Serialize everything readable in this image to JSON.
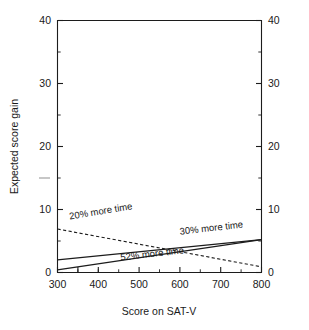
{
  "chart_data": {
    "type": "line",
    "title": "",
    "subtitle": "",
    "xlabel": "Score on SAT-V",
    "ylabel": "Expected score gain",
    "ylabel_right": "Expected score gain",
    "xlim": [
      300,
      800
    ],
    "ylim": [
      0,
      40
    ],
    "x_ticks": [
      300,
      400,
      500,
      600,
      700,
      800
    ],
    "x_tick_labels": [
      "300",
      "400",
      "500",
      "600",
      "700",
      "800"
    ],
    "x_minor_step": 50,
    "y_ticks": [
      0,
      10,
      20,
      30,
      40
    ],
    "y_tick_labels_left": [
      "0",
      "10",
      "20",
      "30",
      "40"
    ],
    "y_tick_labels_right": [
      "0",
      "10",
      "20",
      "30",
      "40"
    ],
    "y_minor_step": 5,
    "grid": false,
    "legend_position": "inline-labels",
    "axes": {
      "left_axis": true,
      "right_axis": true,
      "top_axis": true,
      "bottom_axis": true
    },
    "series": [
      {
        "name": "20% more time",
        "label": "20% more time",
        "style": "dashed",
        "color": "#1c1c1c",
        "x": [
          300,
          800
        ],
        "values": [
          6.9,
          0.9
        ],
        "label_x": 330,
        "label_y": 8.4,
        "label_rotation": -9.5
      },
      {
        "name": "30% more time",
        "label": "30% more time",
        "style": "solid",
        "color": "#1c1c1c",
        "x": [
          300,
          800
        ],
        "values": [
          2.0,
          5.2
        ],
        "label_x": 600,
        "label_y": 6.0,
        "label_rotation": -6.5
      },
      {
        "name": "52% more time",
        "label": "52% more time",
        "style": "solid",
        "color": "#1c1c1c",
        "x": [
          300,
          800
        ],
        "values": [
          0.4,
          5.2
        ],
        "label_x": 455,
        "label_y": 1.9,
        "label_rotation": -6.5
      }
    ],
    "annotations": [
      {
        "name": "stray-tick-mark",
        "description": "faint grey dash left of axis near value 15",
        "y": 15
      }
    ]
  },
  "labels": {
    "x_axis_title": "Score on SAT-V",
    "y_axis_title": "Expected score gain",
    "tick_300": "300",
    "tick_400": "400",
    "tick_500": "500",
    "tick_600": "600",
    "tick_700": "700",
    "tick_800": "800",
    "y_0": "0",
    "y_10": "10",
    "y_20": "20",
    "y_30": "30",
    "y_40": "40",
    "y_0_r": "0",
    "y_10_r": "10",
    "y_20_r": "20",
    "y_30_r": "30",
    "y_40_r": "40",
    "series_20": "20% more time",
    "series_30": "30% more time",
    "series_52": "52% more time"
  },
  "colors": {
    "ink": "#1c1c1c",
    "background": "#ffffff",
    "stray": "#9a9a9a"
  }
}
